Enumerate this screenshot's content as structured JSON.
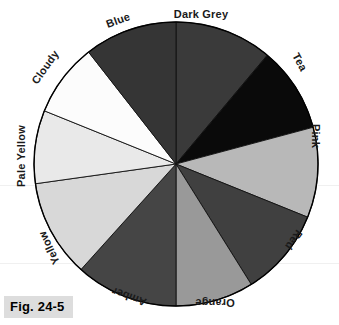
{
  "figure": {
    "caption": "Fig. 24-5",
    "page_bleed_text": "",
    "background_color": "#ffffff",
    "caption_background": "#dddddd",
    "outline_color": "#000000"
  },
  "chart_data": {
    "type": "pie",
    "title": "Fig. 24-5",
    "subtitle": "",
    "xlabel": "",
    "ylabel": "",
    "legend_position": "around-perimeter",
    "grid": false,
    "center": {
      "x": 176,
      "y": 164
    },
    "radius": 142,
    "start_angle_deg": 0,
    "direction": "clockwise",
    "categories": [
      "Dark Grey",
      "Tea",
      "Pink",
      "Red",
      "Orange",
      "Amber",
      "Yellow",
      "Pale Yellow",
      "Cloudy",
      "Blue"
    ],
    "values": [
      40,
      35,
      37,
      36,
      32,
      42,
      40,
      30,
      30,
      38
    ],
    "slices": [
      {
        "label": "Dark Grey",
        "color": "#3a3a3a",
        "start_deg": 0,
        "end_deg": 40,
        "sweep_deg": 40,
        "label_x": 201,
        "label_y": 14,
        "label_rotate": 0
      },
      {
        "label": "Tea",
        "color": "#0a0a0a",
        "start_deg": 40,
        "end_deg": 75,
        "sweep_deg": 35,
        "label_x": 300,
        "label_y": 62,
        "label_rotate": 62
      },
      {
        "label": "Pink",
        "color": "#b8b8b8",
        "start_deg": 75,
        "end_deg": 112,
        "sweep_deg": 37,
        "label_x": 316,
        "label_y": 136,
        "label_rotate": 90
      },
      {
        "label": "Red",
        "color": "#404040",
        "start_deg": 112,
        "end_deg": 148,
        "sweep_deg": 36,
        "label_x": 294,
        "label_y": 240,
        "label_rotate": 125
      },
      {
        "label": "Orange",
        "color": "#999999",
        "start_deg": 148,
        "end_deg": 180,
        "sweep_deg": 32,
        "label_x": 215,
        "label_y": 303,
        "label_rotate": 180
      },
      {
        "label": "Amber",
        "color": "#454545",
        "start_deg": 180,
        "end_deg": 222,
        "sweep_deg": 42,
        "label_x": 129,
        "label_y": 297,
        "label_rotate": 200
      },
      {
        "label": "Yellow",
        "color": "#d8d8d8",
        "start_deg": 222,
        "end_deg": 262,
        "sweep_deg": 40,
        "label_x": 49,
        "label_y": 248,
        "label_rotate": 245
      },
      {
        "label": "Pale Yellow",
        "color": "#e9e9e9",
        "start_deg": 262,
        "end_deg": 292,
        "sweep_deg": 30,
        "label_x": 21,
        "label_y": 156,
        "label_rotate": 270
      },
      {
        "label": "Cloudy",
        "color": "#fcfcfc",
        "start_deg": 292,
        "end_deg": 322,
        "sweep_deg": 30,
        "label_x": 45,
        "label_y": 67,
        "label_rotate": 305
      },
      {
        "label": "Blue",
        "color": "#353535",
        "start_deg": 322,
        "end_deg": 360,
        "sweep_deg": 38,
        "label_x": 118,
        "label_y": 20,
        "label_rotate": 340
      }
    ]
  }
}
